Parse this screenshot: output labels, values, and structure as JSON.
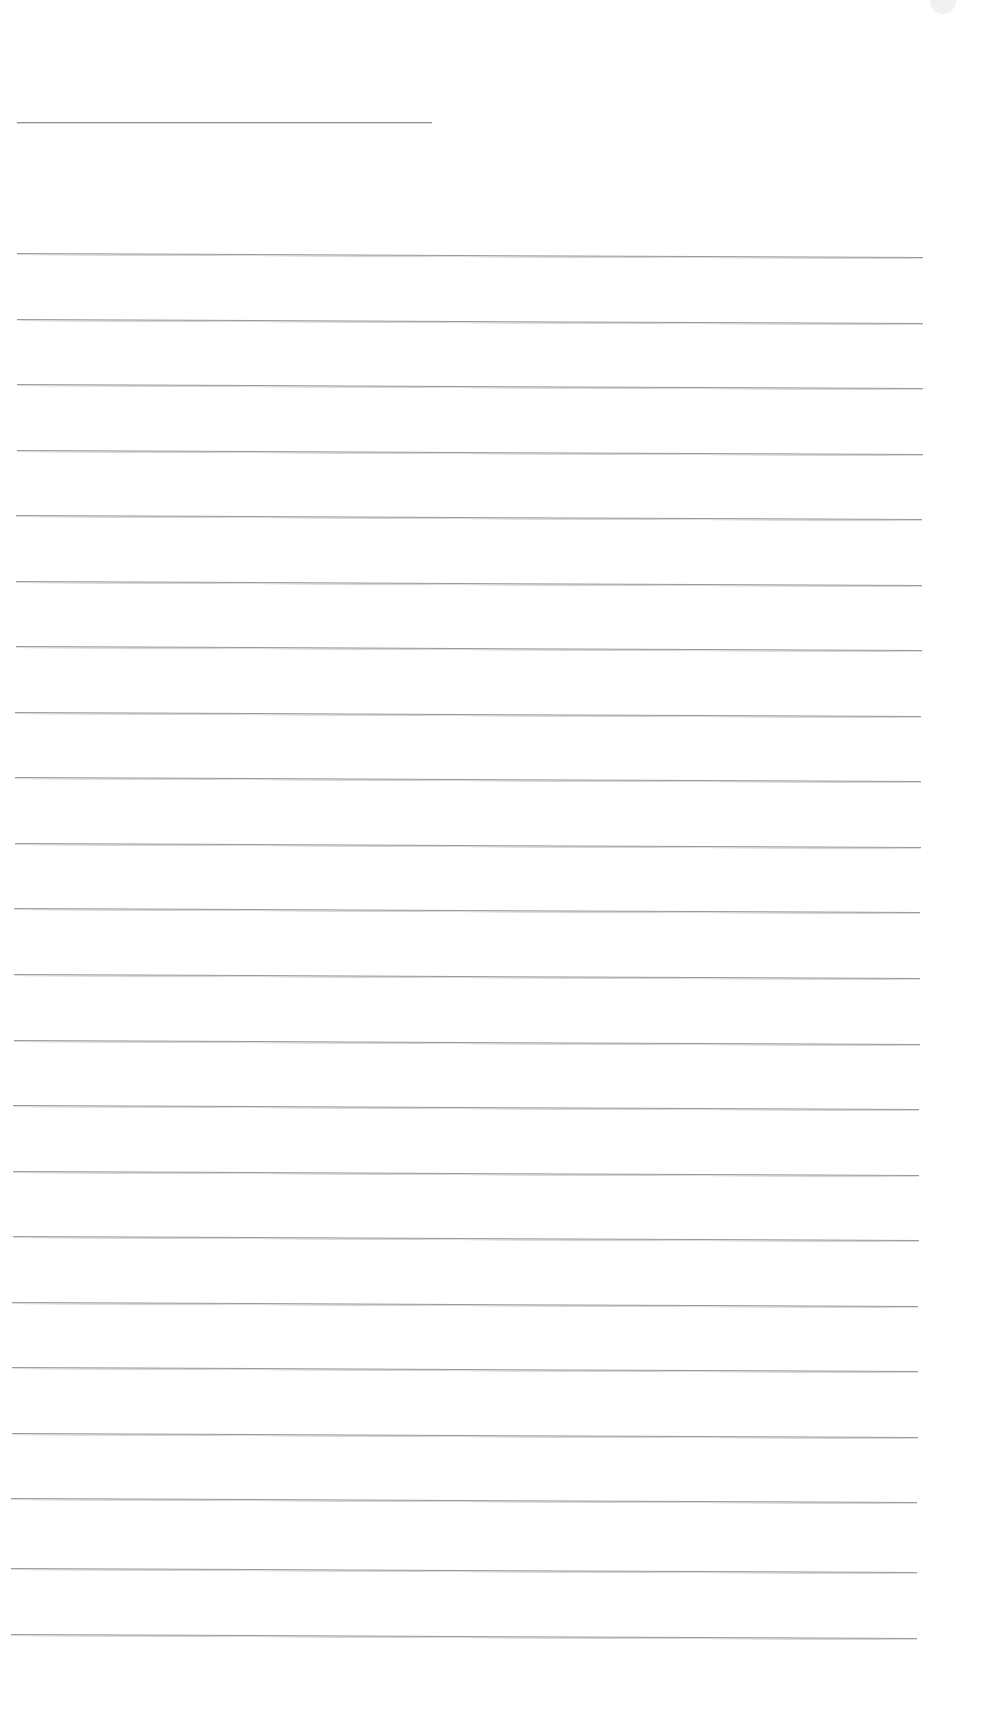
{
  "document": {
    "type": "blank lined sheet",
    "title_line": {
      "present": true,
      "width_px": 415
    },
    "ruled_line_count": 22,
    "line_color": "#9a9a9a",
    "background_color": "#ffffff",
    "text_content": ""
  },
  "rules": [
    {
      "top": 253,
      "left": 17,
      "right": 923
    },
    {
      "top": 319,
      "left": 17,
      "right": 923
    },
    {
      "top": 384,
      "left": 17,
      "right": 923
    },
    {
      "top": 450,
      "left": 17,
      "right": 923
    },
    {
      "top": 515,
      "left": 16,
      "right": 922
    },
    {
      "top": 581,
      "left": 16,
      "right": 922
    },
    {
      "top": 646,
      "left": 16,
      "right": 922
    },
    {
      "top": 712,
      "left": 15,
      "right": 921
    },
    {
      "top": 777,
      "left": 15,
      "right": 921
    },
    {
      "top": 843,
      "left": 15,
      "right": 921
    },
    {
      "top": 908,
      "left": 14,
      "right": 920
    },
    {
      "top": 974,
      "left": 14,
      "right": 920
    },
    {
      "top": 1040,
      "left": 14,
      "right": 920
    },
    {
      "top": 1105,
      "left": 13,
      "right": 919
    },
    {
      "top": 1171,
      "left": 13,
      "right": 919
    },
    {
      "top": 1236,
      "left": 13,
      "right": 919
    },
    {
      "top": 1302,
      "left": 12,
      "right": 918
    },
    {
      "top": 1367,
      "left": 12,
      "right": 918
    },
    {
      "top": 1433,
      "left": 12,
      "right": 918
    },
    {
      "top": 1498,
      "left": 11,
      "right": 917
    },
    {
      "top": 1568,
      "left": 11,
      "right": 917
    },
    {
      "top": 1634,
      "left": 11,
      "right": 917
    }
  ]
}
